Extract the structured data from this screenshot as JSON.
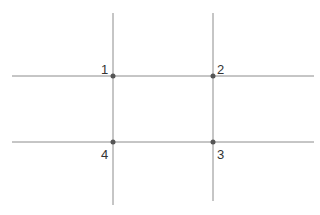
{
  "diagram": {
    "line_color": "#8c8c8c",
    "point_color": "#555555",
    "lines": {
      "horizontal": [
        {
          "id": "top",
          "x1": 12,
          "x2": 314,
          "y": 76
        },
        {
          "id": "bottom",
          "x1": 12,
          "x2": 314,
          "y": 142
        }
      ],
      "vertical": [
        {
          "id": "left",
          "x": 113,
          "y1": 13,
          "y2": 205
        },
        {
          "id": "right",
          "x": 213,
          "y1": 13,
          "y2": 201
        }
      ]
    },
    "points": [
      {
        "label": "1",
        "x": 113,
        "y": 76,
        "label_x": 101,
        "label_y": 63
      },
      {
        "label": "2",
        "x": 213,
        "y": 76,
        "label_x": 217,
        "label_y": 63
      },
      {
        "label": "3",
        "x": 213,
        "y": 142,
        "label_x": 217,
        "label_y": 148
      },
      {
        "label": "4",
        "x": 113,
        "y": 142,
        "label_x": 101,
        "label_y": 148
      }
    ]
  }
}
